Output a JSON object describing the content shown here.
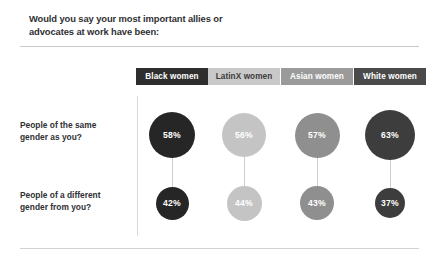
{
  "title": "Would you say your most important allies or\nadvocates at work have been:",
  "columns": [
    {
      "label": "Black women",
      "chip_bg": "#2e2e2e",
      "chip_fg": "#ffffff",
      "center_x": 172
    },
    {
      "label": "LatinX women",
      "chip_bg": "#c9c9c9",
      "chip_fg": "#3a3a3a",
      "center_x": 244
    },
    {
      "label": "Asian women",
      "chip_bg": "#9a9a9a",
      "chip_fg": "#ffffff",
      "center_x": 317
    },
    {
      "label": "White women",
      "chip_bg": "#4a4a4a",
      "chip_fg": "#ffffff",
      "center_x": 390
    }
  ],
  "rows": [
    {
      "label": "People of the same\ngender as you?",
      "center_y": 135
    },
    {
      "label": "People of a different\ngender from you?",
      "center_y": 203
    }
  ],
  "chart_data": {
    "type": "scatter",
    "title": "Would you say your most important allies or advocates at work have been:",
    "xlabel": "",
    "ylabel": "",
    "categories": [
      "Black women",
      "LatinX women",
      "Asian women",
      "White women"
    ],
    "series": [
      {
        "name": "People of the same gender as you?",
        "values": [
          58,
          56,
          57,
          63
        ],
        "labels": [
          "58%",
          "56%",
          "57%",
          "63%"
        ]
      },
      {
        "name": "People of a different gender from you?",
        "values": [
          42,
          44,
          43,
          37
        ],
        "labels": [
          "42%",
          "44%",
          "43%",
          "37%"
        ]
      }
    ],
    "units": "percent",
    "grid": false,
    "legend": "top",
    "note": "Bubble area scales with percentage; bubble color encodes the demographic column."
  },
  "bubbles": [
    {
      "value_label": "58%",
      "cx": 172,
      "cy": 135,
      "d": 46,
      "bg": "#262626",
      "fg": "#ffffff"
    },
    {
      "value_label": "56%",
      "cx": 244,
      "cy": 135,
      "d": 44,
      "bg": "#c4c4c4",
      "fg": "#ffffff"
    },
    {
      "value_label": "57%",
      "cx": 317,
      "cy": 135,
      "d": 45,
      "bg": "#8f8f8f",
      "fg": "#ffffff"
    },
    {
      "value_label": "63%",
      "cx": 390,
      "cy": 135,
      "d": 50,
      "bg": "#3d3d3d",
      "fg": "#ffffff"
    },
    {
      "value_label": "42%",
      "cx": 172,
      "cy": 203,
      "d": 33,
      "bg": "#262626",
      "fg": "#ffffff"
    },
    {
      "value_label": "44%",
      "cx": 244,
      "cy": 203,
      "d": 35,
      "bg": "#c4c4c4",
      "fg": "#ffffff"
    },
    {
      "value_label": "43%",
      "cx": 317,
      "cy": 203,
      "d": 34,
      "bg": "#8f8f8f",
      "fg": "#ffffff"
    },
    {
      "value_label": "37%",
      "cx": 390,
      "cy": 203,
      "d": 30,
      "bg": "#3d3d3d",
      "fg": "#ffffff"
    }
  ],
  "connectors": [
    {
      "x": 172,
      "top": 158,
      "height": 29
    },
    {
      "x": 244,
      "top": 157,
      "height": 29
    },
    {
      "x": 317,
      "top": 157,
      "height": 29
    },
    {
      "x": 390,
      "top": 160,
      "height": 28
    }
  ]
}
